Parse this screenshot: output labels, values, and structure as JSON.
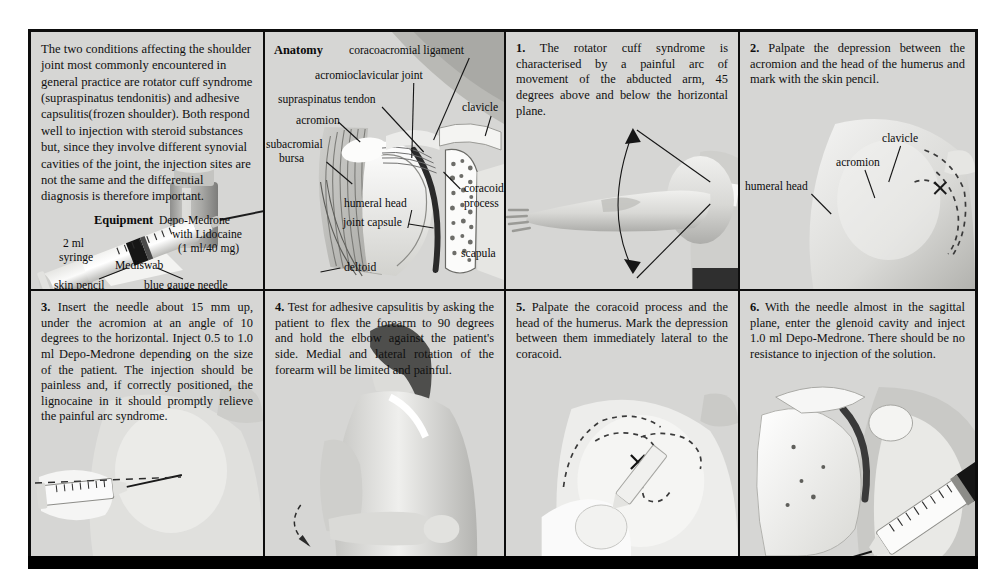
{
  "figure": {
    "background_color": "#d6d6d4",
    "border_color": "#0d0d0d"
  },
  "intro": {
    "text": "The two conditions affecting the shoulder joint most commonly encountered in general practice are rotator cuff syndrome (supraspinatus tendonitis) and adhesive capsulitis(frozen shoulder). Both respond well to injection with steroid substances but, since they involve different synovial cavities of the joint, the injection sites are not the same and the differential diagnosis is therefore important.",
    "equipment_heading": "Equipment",
    "drug_line1": "Depo-Medrone",
    "drug_line2": "with Lidocaine",
    "drug_line3": "(1 ml/40 mg)",
    "label_syringe": "2 ml\nsyringe",
    "label_syringe_line1": "2 ml",
    "label_syringe_line2": "syringe",
    "label_mediswab": "Mediswab",
    "label_skin_pencil": "skin pencil",
    "label_needle": "blue gauge needle"
  },
  "anatomy": {
    "heading": "Anatomy",
    "labels": {
      "coracoacromial_ligament": "coracoacromial ligament",
      "acromioclavicular_joint": "acromioclavicular joint",
      "supraspinatus_tendon": "supraspinatus tendon",
      "acromion": "acromion",
      "subacromial_bursa_line1": "subacromial",
      "subacromial_bursa_line2": "bursa",
      "clavicle": "clavicle",
      "humeral_head": "humeral head",
      "joint_capsule": "joint capsule",
      "coracoid_process_line1": "coracoid",
      "coracoid_process_line2": "process",
      "scapula": "scapula",
      "deltoid": "deltoid"
    }
  },
  "steps": [
    {
      "number": "1.",
      "text": "The rotator cuff syndrome is characterised by a painful arc of movement of the abducted arm, 45 degrees above and below the horizontal plane.",
      "caption": "abducted arm with painful arc"
    },
    {
      "number": "2.",
      "text": "Palpate the depression between the acromion and the head of the humerus and mark with the skin pencil.",
      "labels": {
        "clavicle": "clavicle",
        "acromion": "acromion",
        "humeral_head": "humeral head"
      }
    },
    {
      "number": "3.",
      "text": "Insert the needle about 15 mm up, under the acromion at an angle of 10 degrees to the horizontal. Inject 0.5 to 1.0 ml Depo-Medrone depending on the size of the patient. The injection should be painless and, if correctly positioned, the lignocaine in it should promptly relieve the painful arc syndrome."
    },
    {
      "number": "4.",
      "text": "Test for adhesive capsulitis by asking the patient to flex the forearm to 90 degrees and hold the elbow against the patient's side. Medial and lateral rotation of the forearm will be limited and painful."
    },
    {
      "number": "5.",
      "text": "Palpate the coracoid process and the head of the humerus. Mark the depression between them immediately lateral to the coracoid."
    },
    {
      "number": "6.",
      "text": "With the needle almost in the sagittal plane, enter the glenoid cavity and inject 1.0 ml Depo-Medrone. There should be no resistance to injection of the solution."
    }
  ]
}
